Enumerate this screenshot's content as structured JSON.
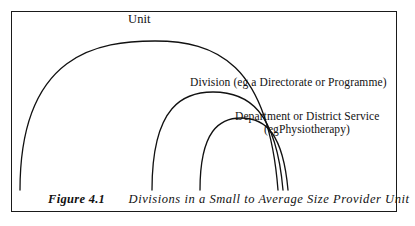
{
  "figure": {
    "caption_number": "Figure 4.1",
    "caption_text": "Divisions in a Small to Average Size Provider Unit",
    "border_color": "#1a1a1a",
    "line_color": "#111111",
    "background_color": "#ffffff"
  },
  "labels": {
    "unit": "Unit",
    "division": "Division (eg a Directorate or Programme)",
    "department_line1": "Department or District Service",
    "department_line2": "(egPhysiotherapy)"
  },
  "diagram_data": {
    "type": "nested-arcs",
    "description": "Three nested arcs representing organisational levels within a provider unit",
    "arcs": [
      {
        "name": "unit-arc",
        "label": "Unit",
        "left_x": 20,
        "right_x": 278,
        "apex_y": 41,
        "baseline_y": 190
      },
      {
        "name": "division-arc",
        "label": "Division (eg a Directorate or Programme)",
        "left_x": 152,
        "right_x": 283,
        "apex_y": 92,
        "baseline_y": 190
      },
      {
        "name": "department-arc",
        "label": "Department or District Service (egPhysiotherapy)",
        "left_x": 200,
        "right_x": 288,
        "apex_y": 118,
        "baseline_y": 190
      }
    ]
  }
}
